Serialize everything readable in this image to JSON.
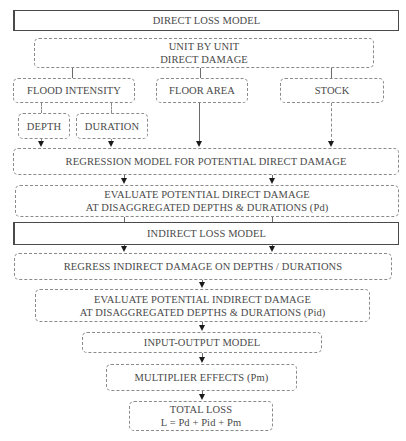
{
  "diagram": {
    "direct_header": "DIRECT LOSS MODEL",
    "unit_by_unit": {
      "line1": "UNIT BY UNIT",
      "line2": "DIRECT DAMAGE"
    },
    "inputs": {
      "flood_intensity": "FLOOD INTENSITY",
      "floor_area": "FLOOR AREA",
      "stock": "STOCK",
      "depth": "DEPTH",
      "duration": "DURATION"
    },
    "regression_direct": "REGRESSION MODEL FOR POTENTIAL DIRECT DAMAGE",
    "evaluate_direct": {
      "line1": "EVALUATE POTENTIAL DIRECT DAMAGE",
      "line2": "AT DISAGGREGATED DEPTHS & DURATIONS (Pd)"
    },
    "indirect_header": "INDIRECT LOSS MODEL",
    "regress_indirect": "REGRESS INDIRECT  DAMAGE ON DEPTHS / DURATIONS",
    "evaluate_indirect": {
      "line1": "EVALUATE POTENTIAL INDIRECT DAMAGE",
      "line2": "AT DISAGGREGATED DEPTHS & DURATIONS (Pid)"
    },
    "input_output": "INPUT-OUTPUT MODEL",
    "multiplier": "MULTIPLIER EFFECTS (Pm)",
    "total_loss": {
      "line1": "TOTAL LOSS",
      "line2": "L = Pd + Pid + Pm"
    }
  },
  "colors": {
    "text": "#4a4a4a",
    "dashed_border": "#8a8a8a",
    "solid_border": "#4a4a4a",
    "arrowhead": "#1a1a1a"
  }
}
